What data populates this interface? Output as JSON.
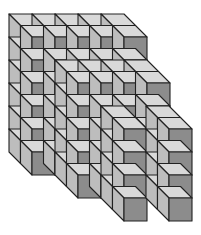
{
  "diagram": {
    "type": "3d-cube-stack",
    "cube_size_px": 23,
    "depth_offset_px": [
      -11.5,
      -11.5
    ],
    "colors": {
      "front": "#8c8c8c",
      "side": "#bdbdbd",
      "top": "#d9d9d9",
      "edge": "#222222",
      "background": "#ffffff"
    },
    "blocks": [
      {
        "name": "back-block",
        "origin": [
          32,
          37
        ],
        "cols": 5,
        "rows": 6,
        "depth": 2
      },
      {
        "name": "middle-block",
        "origin": [
          78,
          83
        ],
        "cols": 4,
        "rows": 5,
        "depth": 2
      },
      {
        "name": "front-column-left",
        "origin": [
          124,
          129
        ],
        "cols": 1,
        "rows": 4,
        "depth": 2
      },
      {
        "name": "front-column-right",
        "origin": [
          169,
          129
        ],
        "cols": 1,
        "rows": 4,
        "depth": 2
      }
    ]
  }
}
